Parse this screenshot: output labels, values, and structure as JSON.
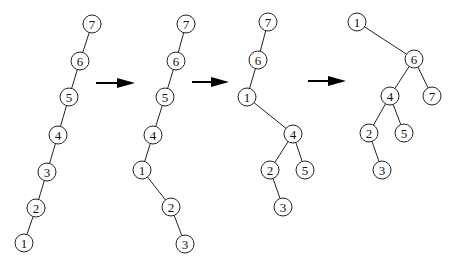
{
  "diagram": {
    "node_radius": 9,
    "stroke_color": "#222222",
    "fill_color": "#ffffff",
    "trees": [
      {
        "id": "tree-1",
        "nodes": [
          {
            "label": "7",
            "x": 92,
            "y": 24
          },
          {
            "label": "6",
            "x": 80,
            "y": 61
          },
          {
            "label": "5",
            "x": 69,
            "y": 97
          },
          {
            "label": "4",
            "x": 58,
            "y": 135
          },
          {
            "label": "3",
            "x": 47,
            "y": 172
          },
          {
            "label": "2",
            "x": 36,
            "y": 208
          },
          {
            "label": "1",
            "x": 24,
            "y": 243
          }
        ],
        "edges": [
          [
            "7",
            "6"
          ],
          [
            "6",
            "5"
          ],
          [
            "5",
            "4"
          ],
          [
            "4",
            "3"
          ],
          [
            "3",
            "2"
          ],
          [
            "2",
            "1"
          ]
        ]
      },
      {
        "id": "tree-2",
        "nodes": [
          {
            "label": "7",
            "x": 186,
            "y": 24
          },
          {
            "label": "6",
            "x": 176,
            "y": 61
          },
          {
            "label": "5",
            "x": 165,
            "y": 97
          },
          {
            "label": "4",
            "x": 153,
            "y": 135
          },
          {
            "label": "1",
            "x": 142,
            "y": 170
          },
          {
            "label": "2",
            "x": 171,
            "y": 207
          },
          {
            "label": "3",
            "x": 185,
            "y": 244
          }
        ],
        "edges": [
          [
            "7",
            "6"
          ],
          [
            "6",
            "5"
          ],
          [
            "5",
            "4"
          ],
          [
            "4",
            "1"
          ],
          [
            "1",
            "2"
          ],
          [
            "2",
            "3"
          ]
        ]
      },
      {
        "id": "tree-3",
        "nodes": [
          {
            "label": "7",
            "x": 268,
            "y": 22
          },
          {
            "label": "6",
            "x": 258,
            "y": 60
          },
          {
            "label": "1",
            "x": 247,
            "y": 97
          },
          {
            "label": "4",
            "x": 293,
            "y": 134
          },
          {
            "label": "2",
            "x": 270,
            "y": 170
          },
          {
            "label": "5",
            "x": 305,
            "y": 170
          },
          {
            "label": "3",
            "x": 283,
            "y": 207
          }
        ],
        "edges": [
          [
            "7",
            "6"
          ],
          [
            "6",
            "1"
          ],
          [
            "1",
            "4"
          ],
          [
            "4",
            "2"
          ],
          [
            "4",
            "5"
          ],
          [
            "2",
            "3"
          ]
        ]
      },
      {
        "id": "tree-4",
        "nodes": [
          {
            "label": "1",
            "x": 357,
            "y": 22
          },
          {
            "label": "6",
            "x": 414,
            "y": 59
          },
          {
            "label": "4",
            "x": 390,
            "y": 96
          },
          {
            "label": "7",
            "x": 432,
            "y": 96
          },
          {
            "label": "2",
            "x": 369,
            "y": 133
          },
          {
            "label": "5",
            "x": 404,
            "y": 133
          },
          {
            "label": "3",
            "x": 382,
            "y": 170
          }
        ],
        "edges": [
          [
            "1",
            "6"
          ],
          [
            "6",
            "4"
          ],
          [
            "6",
            "7"
          ],
          [
            "4",
            "2"
          ],
          [
            "4",
            "5"
          ],
          [
            "2",
            "3"
          ]
        ]
      }
    ],
    "arrows": [
      {
        "x1": 96,
        "y1": 83,
        "x2": 135,
        "y2": 83
      },
      {
        "x1": 192,
        "y1": 82,
        "x2": 229,
        "y2": 82
      },
      {
        "x1": 308,
        "y1": 81,
        "x2": 346,
        "y2": 81
      }
    ]
  }
}
